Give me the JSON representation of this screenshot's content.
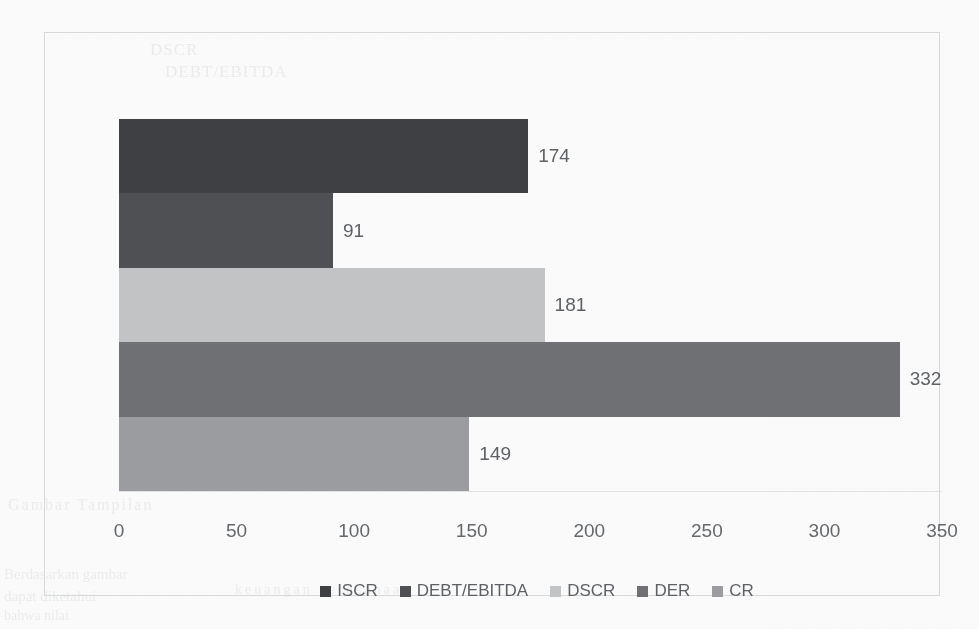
{
  "chart_data": {
    "type": "bar",
    "orientation": "horizontal",
    "title": "",
    "subtitle": "",
    "xlabel": "",
    "ylabel": "",
    "categories": [
      "ISCR",
      "DEBT/EBITDA",
      "DSCR",
      "DER",
      "CR"
    ],
    "values": [
      174,
      91,
      181,
      332,
      149
    ],
    "data_labels": [
      "174",
      "91",
      "181",
      "332",
      "149"
    ],
    "colors": [
      "#3f4043",
      "#4f5053",
      "#c3c4c6",
      "#6f7174",
      "#9b9da0"
    ],
    "xlim": [
      0,
      350
    ],
    "xticks": [
      0,
      50,
      100,
      150,
      200,
      250,
      300,
      350
    ],
    "xticklabels": [
      "0",
      "50",
      "100",
      "150",
      "200",
      "250",
      "300",
      "350"
    ],
    "grid": false,
    "legend_position": "bottom",
    "legend": [
      {
        "label": "ISCR",
        "color": "#3f4043"
      },
      {
        "label": "DEBT/EBITDA",
        "color": "#4f5053"
      },
      {
        "label": "DSCR",
        "color": "#c3c4c6"
      },
      {
        "label": "DER",
        "color": "#6f7174"
      },
      {
        "label": "CR",
        "color": "#9b9da0"
      }
    ]
  },
  "frame": {
    "border_color": "#d9dadb",
    "background": "#fbfbfb"
  },
  "bleed_through": {
    "line_a": "DSCR",
    "line_b": "DEBT/EBITDA",
    "line_c": "Gambar Tampilan",
    "line_d": "Berdasarkan gambar",
    "line_e": "dapat diketahui",
    "line_f": "bahwa nilai",
    "line_g": "keuangan perusahaan"
  }
}
